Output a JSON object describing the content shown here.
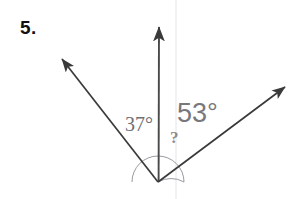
{
  "figure": {
    "problem_number": "5.",
    "background_color": "#ffffff",
    "stroke_color": "#3a3a3a",
    "arc_color": "#8a8a8f",
    "scan_line_color": "#f2f2f4",
    "vertex": {
      "x": 158,
      "y": 182
    },
    "rays": [
      {
        "name": "ray-upper-left",
        "tip": {
          "x": 59,
          "y": 56
        },
        "arrowhead": "solid-filled"
      },
      {
        "name": "ray-vertical-up",
        "tip": {
          "x": 159,
          "y": 24
        },
        "arrowhead": "solid-filled"
      },
      {
        "name": "ray-upper-right",
        "tip": {
          "x": 288,
          "y": 84
        },
        "arrowhead": "solid-filled"
      }
    ],
    "angle_arc": {
      "name": "angle-arc",
      "radius": 26,
      "spans": "both-angles"
    },
    "labels": {
      "left_angle": "37°",
      "left_angle_color": "#6e6e73",
      "right_angle": "53°",
      "right_angle_color": "#77777c",
      "unknown": "?",
      "unknown_color": "#8a8a8f"
    }
  }
}
